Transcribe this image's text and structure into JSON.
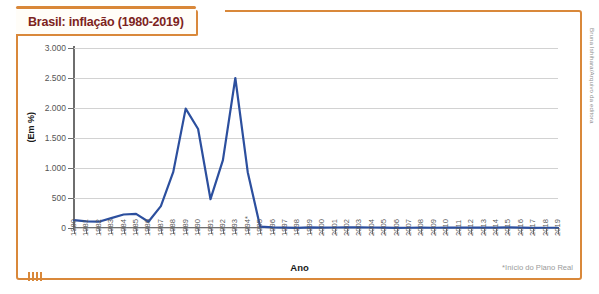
{
  "title": "Brasil: inflação (1980-2019)",
  "credit": "Bruna Ishihara/Arquivo da editora",
  "colors": {
    "frame": "#d9883a",
    "title_text": "#7d2320",
    "line": "#2c4f9e",
    "grid": "#d2d2d2",
    "axis": "#6e6e6e",
    "footnote": "#9a9a9a"
  },
  "chart_data": {
    "type": "line",
    "title": "Brasil: inflação (1980-2019)",
    "xlabel": "Ano",
    "ylabel": "(Em %)",
    "ylim": [
      0,
      3000
    ],
    "yticks": [
      0,
      500,
      1000,
      1500,
      2000,
      2500,
      3000
    ],
    "ytick_labels": [
      "0",
      "500",
      "1.000",
      "1.500",
      "2.000",
      "2.500",
      "3.000"
    ],
    "grid": true,
    "legend": null,
    "annotation": "*Início do Plano Real",
    "annotation_marker_on_category": "1994*",
    "categories": [
      "1980",
      "1981",
      "1982",
      "1983",
      "1984",
      "1985",
      "1986",
      "1987",
      "1988",
      "1989",
      "1990",
      "1991",
      "1992",
      "1993",
      "1994*",
      "1995",
      "1996",
      "1997",
      "1998",
      "1999",
      "2000",
      "2001",
      "2002",
      "2003",
      "2004",
      "2005",
      "2006",
      "2007",
      "2008",
      "2009",
      "2010",
      "2011",
      "2012",
      "2013",
      "2014",
      "2015",
      "2016",
      "2017",
      "2018",
      "2019"
    ],
    "values": [
      130,
      110,
      105,
      165,
      225,
      235,
      105,
      365,
      935,
      1990,
      1650,
      480,
      1130,
      2500,
      930,
      22,
      9,
      5,
      2,
      9,
      6,
      8,
      12,
      9,
      8,
      6,
      3,
      4,
      6,
      4,
      6,
      7,
      5,
      6,
      6,
      11,
      6,
      3,
      4,
      4
    ]
  }
}
